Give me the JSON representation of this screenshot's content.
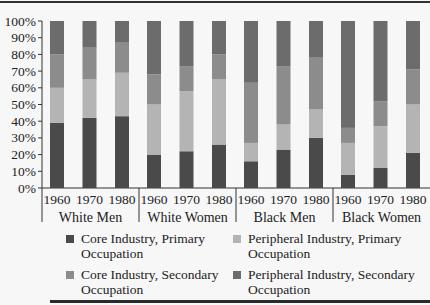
{
  "chart_data": {
    "type": "bar",
    "stacked": true,
    "percent": true,
    "title": "",
    "xlabel": "",
    "ylabel": "",
    "ylim": [
      0,
      100
    ],
    "yticks": [
      "0%",
      "10%",
      "20%",
      "30%",
      "40%",
      "50%",
      "60%",
      "70%",
      "80%",
      "90%",
      "100%"
    ],
    "groups": [
      "White Men",
      "White Women",
      "Black Men",
      "Black Women"
    ],
    "categories": [
      "1960",
      "1970",
      "1980",
      "1960",
      "1970",
      "1980",
      "1960",
      "1970",
      "1980",
      "1960",
      "1970",
      "1980"
    ],
    "series": [
      {
        "name": "Core Industry, Primary Occupation",
        "color": "#4a4a4a",
        "values": [
          39,
          42,
          43,
          20,
          22,
          26,
          16,
          23,
          30,
          8,
          12,
          21
        ]
      },
      {
        "name": "Peripheral Industry, Primary Occupation",
        "color": "#b4b4b4",
        "values": [
          21,
          23,
          26,
          30,
          36,
          39,
          11,
          15,
          17,
          19,
          25,
          29
        ]
      },
      {
        "name": "Core Industry, Secondary Occupation",
        "color": "#8c8c8c",
        "values": [
          20,
          19,
          18,
          18,
          15,
          15,
          36,
          35,
          31,
          9,
          15,
          21
        ]
      },
      {
        "name": "Peripheral Industry, Secondary Occupation",
        "color": "#6c6c6c",
        "values": [
          20,
          16,
          13,
          32,
          27,
          20,
          37,
          27,
          22,
          64,
          48,
          29
        ]
      }
    ],
    "legend_position": "bottom",
    "grid": false
  },
  "legend": {
    "items": [
      {
        "line1": "Core Industry, Primary",
        "line2": "Occupation"
      },
      {
        "line1": "Peripheral Industry, Primary",
        "line2": "Occupation"
      },
      {
        "line1": "Core Industry, Secondary",
        "line2": "Occupation"
      },
      {
        "line1": "Peripheral Industry, Secondary",
        "line2": "Occupation"
      }
    ]
  }
}
